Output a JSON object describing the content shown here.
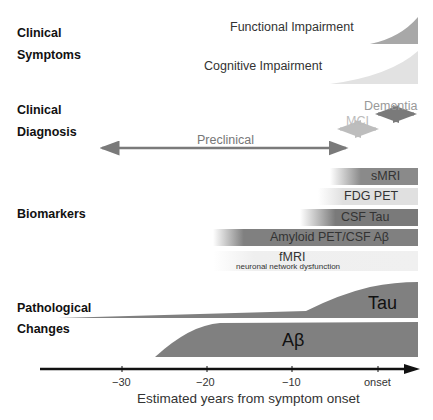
{
  "row_labels": {
    "clinical_symptoms": [
      "Clinical",
      "Symptoms"
    ],
    "clinical_diagnosis": [
      "Clinical",
      "Diagnosis"
    ],
    "biomarkers": "Biomarkers",
    "pathological_changes": [
      "Pathological",
      "Changes"
    ]
  },
  "symptoms": {
    "functional": "Functional Impairment",
    "cognitive": "Cognitive Impairment"
  },
  "diagnosis": {
    "dementia": "Dementia",
    "mci": "MCI",
    "preclinical": "Preclinical"
  },
  "biomarkers": [
    {
      "name": "sMRI",
      "sub": ""
    },
    {
      "name": "FDG PET",
      "sub": ""
    },
    {
      "name": "CSF Tau",
      "sub": ""
    },
    {
      "name": "Amyloid PET/CSF Aβ",
      "sub": ""
    },
    {
      "name": "fMRI",
      "sub": "neuronal network dysfunction"
    }
  ],
  "pathology": {
    "tau": "Tau",
    "abeta": "Aβ"
  },
  "axis": {
    "ticks": [
      "−30",
      "−20",
      "−10",
      "onset"
    ],
    "label": "Estimated years from symptom onset"
  },
  "colors": {
    "dark_gray": "#7a7a7a",
    "mid_gray": "#a0a0a0",
    "light_gray": "#d6d6d6",
    "pale_gray": "#ececec",
    "axis": "#111111"
  }
}
